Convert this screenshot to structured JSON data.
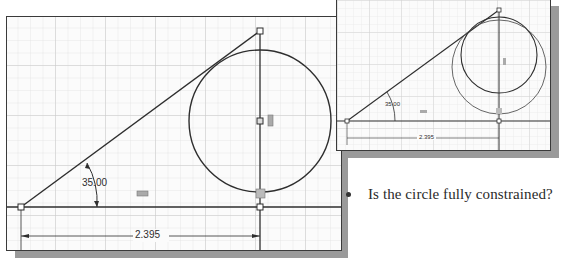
{
  "main_sketch": {
    "angle_dimension": "35.00",
    "linear_dimension": "2.395",
    "description": "Sketch: inclined line at 35° from baseline, tangent to circle whose center lies on vertical construction line; horizontal dimension 2.395"
  },
  "inset_sketch": {
    "angle_dimension": "35.00",
    "linear_dimension": "2.395",
    "description": "Same sketch showing circle dragged to a different size (two circles), indicating under-constrained"
  },
  "question": {
    "bullet_text": "Is the circle fully constrained?"
  },
  "colors": {
    "line": "#2e2e2e",
    "grid_minor": "#dedede",
    "grid_major": "#c4c4c4",
    "shadow": "#9a9a9a",
    "panel_bg": "#fbfbfb"
  }
}
